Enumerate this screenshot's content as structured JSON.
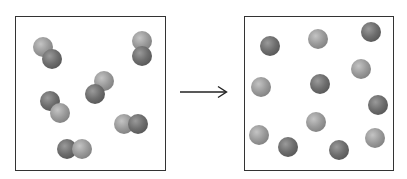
{
  "diagram": {
    "arrow": {
      "direction": "right",
      "color": "#222222"
    },
    "colors": {
      "light_atom": "#9a9a9a",
      "dark_atom": "#6e6e6e",
      "border": "#333333"
    },
    "left_box": {
      "label": "reactants",
      "molecule_count": 6,
      "molecules": [
        {
          "atoms": [
            {
              "x": 43,
              "y": 47,
              "shade": "light"
            },
            {
              "x": 52,
              "y": 59,
              "shade": "dark"
            }
          ]
        },
        {
          "atoms": [
            {
              "x": 142,
              "y": 41,
              "shade": "light"
            },
            {
              "x": 142,
              "y": 56,
              "shade": "dark"
            }
          ]
        },
        {
          "atoms": [
            {
              "x": 104,
              "y": 81,
              "shade": "light"
            },
            {
              "x": 95,
              "y": 94,
              "shade": "dark"
            }
          ]
        },
        {
          "atoms": [
            {
              "x": 50,
              "y": 101,
              "shade": "dark"
            },
            {
              "x": 60,
              "y": 113,
              "shade": "light"
            }
          ]
        },
        {
          "atoms": [
            {
              "x": 124,
              "y": 124,
              "shade": "light"
            },
            {
              "x": 138,
              "y": 124,
              "shade": "dark"
            }
          ]
        },
        {
          "atoms": [
            {
              "x": 67,
              "y": 149,
              "shade": "dark"
            },
            {
              "x": 82,
              "y": 149,
              "shade": "light"
            }
          ]
        }
      ]
    },
    "right_box": {
      "label": "products",
      "atom_count": 12,
      "atoms": [
        {
          "x": 270,
          "y": 46,
          "shade": "dark"
        },
        {
          "x": 318,
          "y": 39,
          "shade": "light"
        },
        {
          "x": 371,
          "y": 32,
          "shade": "dark"
        },
        {
          "x": 361,
          "y": 69,
          "shade": "light"
        },
        {
          "x": 261,
          "y": 87,
          "shade": "light"
        },
        {
          "x": 320,
          "y": 84,
          "shade": "dark"
        },
        {
          "x": 378,
          "y": 105,
          "shade": "dark"
        },
        {
          "x": 316,
          "y": 122,
          "shade": "light"
        },
        {
          "x": 259,
          "y": 135,
          "shade": "light"
        },
        {
          "x": 288,
          "y": 147,
          "shade": "dark"
        },
        {
          "x": 339,
          "y": 150,
          "shade": "dark"
        },
        {
          "x": 375,
          "y": 138,
          "shade": "light"
        }
      ]
    }
  }
}
